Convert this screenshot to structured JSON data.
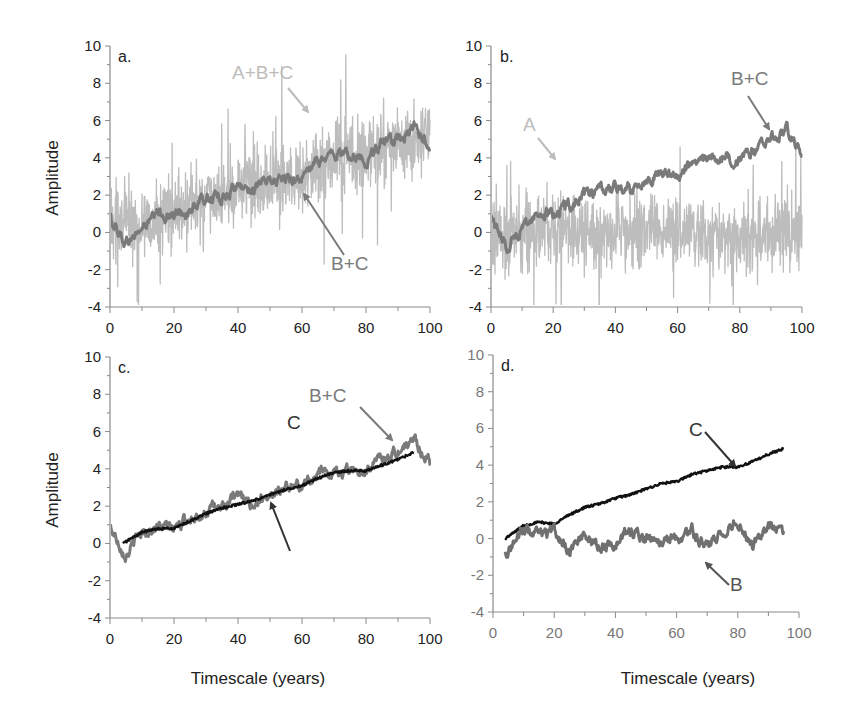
{
  "figure": {
    "xlabel": "Timescale (years)",
    "ylabel": "Amplitude",
    "colors": {
      "A_light": "#bdbdbd",
      "BC_mid": "#7a7a7a",
      "C_dark": "#111111",
      "B_mid": "#707070",
      "axis": "#8a8a8a"
    }
  },
  "chart_data": [
    {
      "panel": "a.",
      "type": "line",
      "xlabel": "",
      "ylabel": "Amplitude",
      "xlim": [
        0,
        100
      ],
      "ylim": [
        -4,
        10
      ],
      "xticks": [
        0,
        20,
        40,
        60,
        80,
        100
      ],
      "yticks": [
        -4,
        -2,
        0,
        2,
        4,
        6,
        8,
        10
      ],
      "annotations": [
        {
          "text": "A+B+C",
          "color": "#bdbdbd"
        },
        {
          "text": "B+C",
          "color": "#7a7a7a"
        }
      ],
      "series": [
        {
          "name": "A+B+C",
          "color": "#bdbdbd",
          "description": "high-frequency noise (A) added to B+C; range approx -4 to 8.3",
          "x": [
            0,
            10,
            20,
            30,
            40,
            50,
            60,
            70,
            80,
            90,
            100
          ],
          "values": [
            0.8,
            0.2,
            1.0,
            1.6,
            2.4,
            2.9,
            3.0,
            4.0,
            4.2,
            4.8,
            5.0
          ]
        },
        {
          "name": "B+C",
          "color": "#7a7a7a",
          "x": [
            0,
            5,
            10,
            15,
            20,
            25,
            30,
            35,
            40,
            45,
            50,
            55,
            60,
            65,
            70,
            75,
            80,
            85,
            90,
            95,
            100
          ],
          "values": [
            0.8,
            -0.6,
            0.2,
            1.0,
            0.9,
            1.2,
            1.8,
            1.9,
            2.4,
            2.4,
            2.7,
            2.9,
            2.9,
            3.8,
            4.2,
            4.2,
            3.9,
            4.8,
            4.8,
            5.6,
            4.7
          ]
        }
      ]
    },
    {
      "panel": "b.",
      "type": "line",
      "xlabel": "",
      "ylabel": "",
      "xlim": [
        0,
        100
      ],
      "ylim": [
        -4,
        10
      ],
      "xticks": [
        0,
        20,
        40,
        60,
        80,
        100
      ],
      "yticks": [
        -4,
        -2,
        0,
        2,
        4,
        6,
        8,
        10
      ],
      "annotations": [
        {
          "text": "A",
          "color": "#bdbdbd"
        },
        {
          "text": "B+C",
          "color": "#7a7a7a"
        }
      ],
      "series": [
        {
          "name": "A",
          "color": "#bdbdbd",
          "description": "white noise about 0, range approx -4 to 3.5",
          "x": [
            0,
            20,
            40,
            60,
            80,
            100
          ],
          "values": [
            0,
            0,
            0,
            0,
            0,
            0
          ]
        },
        {
          "name": "B+C",
          "color": "#7a7a7a",
          "x": [
            0,
            5,
            10,
            15,
            20,
            25,
            30,
            35,
            40,
            45,
            50,
            55,
            60,
            65,
            70,
            75,
            80,
            85,
            90,
            95,
            100
          ],
          "values": [
            0.9,
            -0.8,
            0.3,
            1.0,
            1.0,
            1.5,
            1.9,
            2.2,
            2.4,
            2.3,
            2.9,
            3.2,
            3.0,
            3.8,
            3.9,
            4.1,
            3.8,
            4.4,
            5.1,
            5.5,
            4.3
          ]
        }
      ]
    },
    {
      "panel": "c.",
      "type": "line",
      "xlabel": "Timescale (years)",
      "ylabel": "Amplitude",
      "xlim": [
        0,
        100
      ],
      "ylim": [
        -4,
        10
      ],
      "xticks": [
        0,
        20,
        40,
        60,
        80,
        100
      ],
      "yticks": [
        -4,
        -2,
        0,
        2,
        4,
        6,
        8,
        10
      ],
      "annotations": [
        {
          "text": "B+C",
          "color": "#7a7a7a"
        },
        {
          "text": "C",
          "color": "#333333"
        }
      ],
      "series": [
        {
          "name": "B+C",
          "color": "#7a7a7a",
          "x": [
            0,
            5,
            10,
            15,
            20,
            25,
            30,
            35,
            40,
            45,
            50,
            55,
            60,
            65,
            70,
            75,
            80,
            85,
            90,
            95,
            100
          ],
          "values": [
            0.9,
            -0.6,
            0.6,
            0.9,
            0.8,
            1.4,
            1.7,
            2.0,
            2.5,
            2.1,
            2.7,
            3.0,
            3.1,
            3.8,
            3.8,
            4.0,
            3.9,
            4.6,
            4.9,
            5.6,
            4.3
          ]
        },
        {
          "name": "C",
          "color": "#111111",
          "x": [
            4,
            10,
            15,
            20,
            25,
            30,
            35,
            40,
            45,
            50,
            55,
            60,
            65,
            70,
            75,
            80,
            85,
            90,
            95
          ],
          "values": [
            0.0,
            0.6,
            0.8,
            0.8,
            1.2,
            1.6,
            1.9,
            2.1,
            2.3,
            2.6,
            2.9,
            3.1,
            3.5,
            3.8,
            3.9,
            3.9,
            4.2,
            4.5,
            4.9
          ]
        }
      ]
    },
    {
      "panel": "d.",
      "type": "line",
      "xlabel": "Timescale (years)",
      "ylabel": "",
      "xlim": [
        0,
        100
      ],
      "ylim": [
        -4,
        10
      ],
      "xticks": [
        0,
        20,
        40,
        60,
        80,
        100
      ],
      "yticks": [
        -4,
        -2,
        0,
        2,
        4,
        6,
        8,
        10
      ],
      "annotations": [
        {
          "text": "C",
          "color": "#333333"
        },
        {
          "text": "B",
          "color": "#555555"
        }
      ],
      "series": [
        {
          "name": "C",
          "color": "#111111",
          "x": [
            4,
            10,
            15,
            20,
            25,
            30,
            35,
            40,
            45,
            50,
            55,
            60,
            65,
            70,
            75,
            80,
            85,
            90,
            95
          ],
          "values": [
            0.0,
            0.7,
            0.9,
            0.8,
            1.3,
            1.7,
            1.9,
            2.2,
            2.4,
            2.7,
            3.0,
            3.1,
            3.5,
            3.7,
            3.9,
            3.9,
            4.2,
            4.6,
            4.9
          ]
        },
        {
          "name": "B",
          "color": "#707070",
          "description": "red-noise oscillation about 0, range approx -1.3 to 1.2",
          "x": [
            4,
            10,
            15,
            20,
            25,
            30,
            35,
            40,
            45,
            50,
            55,
            60,
            65,
            70,
            75,
            80,
            85,
            90,
            95
          ],
          "values": [
            -0.8,
            0.5,
            0.2,
            0.3,
            -0.6,
            0.3,
            -0.4,
            -0.2,
            0.4,
            0.0,
            -0.2,
            0.1,
            0.4,
            -0.5,
            0.3,
            0.9,
            -0.3,
            0.6,
            0.2
          ]
        }
      ]
    }
  ]
}
